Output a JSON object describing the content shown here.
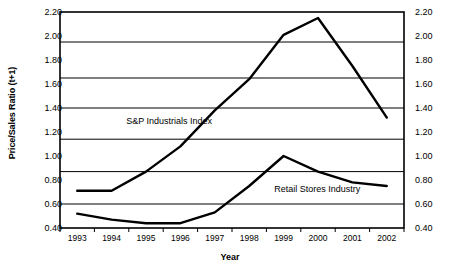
{
  "chart_data": {
    "type": "line",
    "title": "",
    "xlabel": "Year",
    "ylabel": "Price/Sales Ratio (t+1)",
    "ylabel_right": "Price/Sales Ratio (t+1)",
    "categories": [
      "1993",
      "1994",
      "1995",
      "1996",
      "1997",
      "1998",
      "1999",
      "2000",
      "2001",
      "2002"
    ],
    "x": [
      1993,
      1994,
      1995,
      1996,
      1997,
      1998,
      1999,
      2000,
      2001,
      2002
    ],
    "ylim": [
      0.4,
      2.2
    ],
    "ytick_step": 0.2,
    "yticks": [
      "2.20",
      "2.00",
      "1.80",
      "1.60",
      "1.40",
      "1.20",
      "1.00",
      "0.80",
      "0.60",
      "0.40"
    ],
    "ytick_values": [
      2.2,
      2.0,
      1.8,
      1.6,
      1.4,
      1.2,
      1.0,
      0.8,
      0.6,
      0.4
    ],
    "gridlines": [
      1.95,
      1.65,
      1.4,
      1.14,
      0.87,
      0.6
    ],
    "grid": true,
    "grid_axis": "y",
    "legend_position": "inline-annotation",
    "series": [
      {
        "name": "S&P Industrials Index",
        "values": [
          0.71,
          0.71,
          0.87,
          1.08,
          1.38,
          1.64,
          2.01,
          2.15,
          1.75,
          1.32
        ]
      },
      {
        "name": "Retail Stores Industry",
        "values": [
          0.52,
          0.47,
          0.44,
          0.44,
          0.53,
          0.75,
          1.0,
          0.87,
          0.78,
          0.75
        ]
      }
    ],
    "annotations": [
      {
        "text": "S&P Industrials Index",
        "x": 1994.6,
        "y": 1.28
      },
      {
        "text": "Retail Stores Industry",
        "x": 1998.9,
        "y": 0.72
      }
    ],
    "colors": {
      "line": "#000000",
      "grid": "#000000",
      "axis": "#000000",
      "background": "#ffffff"
    }
  },
  "axes": {
    "y_title": "Price/Sales Ratio (t+1)",
    "x_title": "Year"
  }
}
